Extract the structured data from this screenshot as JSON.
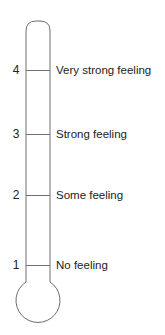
{
  "diagram": {
    "type": "feeling-thermometer",
    "stroke_color": "#6e6e6e",
    "text_color": "#222222",
    "levels": [
      {
        "value": "4",
        "label": "Very strong feeling",
        "y": 70
      },
      {
        "value": "3",
        "label": "Strong feeling",
        "y": 134
      },
      {
        "value": "2",
        "label": "Some feeling",
        "y": 195
      },
      {
        "value": "1",
        "label": "No feeling",
        "y": 265
      }
    ]
  }
}
